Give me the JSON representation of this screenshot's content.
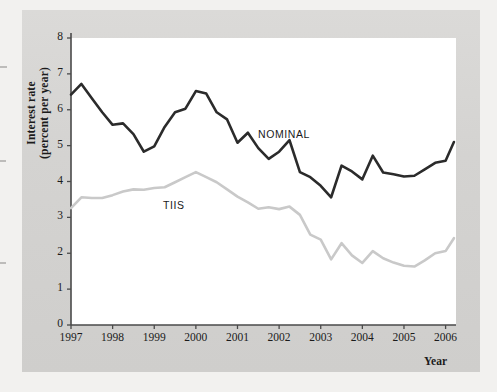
{
  "figure": {
    "y_axis_label": "Interest rate\n(percent per year)",
    "y_axis_label_line1": "Interest rate",
    "y_axis_label_line2": "(percent per year)",
    "x_axis_label": "Year",
    "background_color": "#d6d5d3",
    "plot_background_color": "#ffffff",
    "page_color": "#f2f1ef"
  },
  "chart_data": {
    "type": "line",
    "title": "",
    "xlabel": "Year",
    "ylabel": "Interest rate (percent per year)",
    "xlim": [
      1997,
      2006.25
    ],
    "ylim": [
      0,
      8
    ],
    "ytick_values": [
      0,
      1,
      2,
      3,
      4,
      5,
      6,
      7,
      8
    ],
    "ytick_labels": [
      "0",
      "1",
      "2",
      "3",
      "4",
      "5",
      "6",
      "7",
      "8"
    ],
    "xtick_values": [
      1997,
      1998,
      1999,
      2000,
      2001,
      2002,
      2003,
      2004,
      2005,
      2006
    ],
    "xtick_labels": [
      "1997",
      "1998",
      "1999",
      "2000",
      "2001",
      "2002",
      "2003",
      "2004",
      "2005",
      "2006"
    ],
    "grid": false,
    "legend_position": "inline-annotation",
    "annotations": [
      {
        "text": "NOMINAL",
        "x": 2001.55,
        "y": 5.55
      },
      {
        "text": "TIIS",
        "x": 1999.2,
        "y": 3.62
      }
    ],
    "series": [
      {
        "name": "NOMINAL",
        "color": "#2b2b2b",
        "line_width": 2.6,
        "x": [
          1997.0,
          1997.25,
          1997.5,
          1997.75,
          1998.0,
          1998.25,
          1998.5,
          1998.75,
          1999.0,
          1999.25,
          1999.5,
          1999.75,
          2000.0,
          2000.25,
          2000.5,
          2000.75,
          2001.0,
          2001.25,
          2001.5,
          2001.75,
          2002.0,
          2002.25,
          2002.5,
          2002.75,
          2003.0,
          2003.25,
          2003.5,
          2003.75,
          2004.0,
          2004.25,
          2004.5,
          2004.75,
          2005.0,
          2005.25,
          2005.5,
          2005.75,
          2006.0,
          2006.2
        ],
        "y": [
          6.42,
          6.72,
          6.32,
          5.93,
          5.58,
          5.62,
          5.32,
          4.83,
          4.98,
          5.52,
          5.93,
          6.03,
          6.52,
          6.45,
          5.93,
          5.73,
          5.08,
          5.36,
          4.93,
          4.63,
          4.83,
          5.15,
          4.26,
          4.12,
          3.88,
          3.56,
          4.44,
          4.28,
          4.06,
          4.72,
          4.25,
          4.2,
          4.14,
          4.16,
          4.34,
          4.52,
          4.58,
          5.1
        ]
      },
      {
        "name": "TIIS",
        "color": "#c9c9c9",
        "line_width": 2.6,
        "x": [
          1997.0,
          1997.25,
          1997.5,
          1997.75,
          1998.0,
          1998.25,
          1998.5,
          1998.75,
          1999.0,
          1999.25,
          1999.5,
          1999.75,
          2000.0,
          2000.25,
          2000.5,
          2000.75,
          2001.0,
          2001.25,
          2001.5,
          2001.75,
          2002.0,
          2002.25,
          2002.5,
          2002.75,
          2003.0,
          2003.25,
          2003.5,
          2003.75,
          2004.0,
          2004.25,
          2004.5,
          2004.75,
          2005.0,
          2005.25,
          2005.5,
          2005.75,
          2006.0,
          2006.2
        ],
        "y": [
          3.26,
          3.56,
          3.54,
          3.54,
          3.62,
          3.72,
          3.78,
          3.77,
          3.82,
          3.84,
          3.98,
          4.12,
          4.26,
          4.12,
          3.98,
          3.78,
          3.58,
          3.42,
          3.24,
          3.28,
          3.23,
          3.3,
          3.07,
          2.52,
          2.38,
          1.83,
          2.28,
          1.94,
          1.73,
          2.06,
          1.86,
          1.74,
          1.65,
          1.63,
          1.8,
          2.0,
          2.06,
          2.42
        ]
      }
    ]
  }
}
